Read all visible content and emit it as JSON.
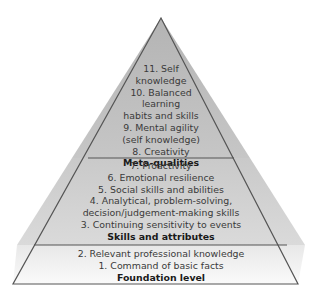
{
  "diagram": {
    "type": "pyramid",
    "colors": {
      "top_fill": "#bdbdbd",
      "middle_fill": "#cfcfcf",
      "bottom_fill": "#f2f2f2",
      "outline": "#555555"
    },
    "tiers": [
      {
        "label": "Meta-qualities",
        "items": [
          "11. Self",
          "knowledge",
          "10. Balanced",
          "learning",
          "habits and skills",
          "9. Mental agility",
          "(self knowledge)",
          "8. Creativity"
        ]
      },
      {
        "label": "Skills and attributes",
        "items": [
          "7. Proactivity",
          "6. Emotional resilience",
          "5. Social skills and abilities",
          "4. Analytical, problem-solving,",
          "decision/judgement-making skills",
          "3. Continuing sensitivity to events"
        ]
      },
      {
        "label": "Foundation level",
        "items": [
          "2. Relevant professional knowledge",
          "1. Command of basic facts"
        ]
      }
    ]
  }
}
